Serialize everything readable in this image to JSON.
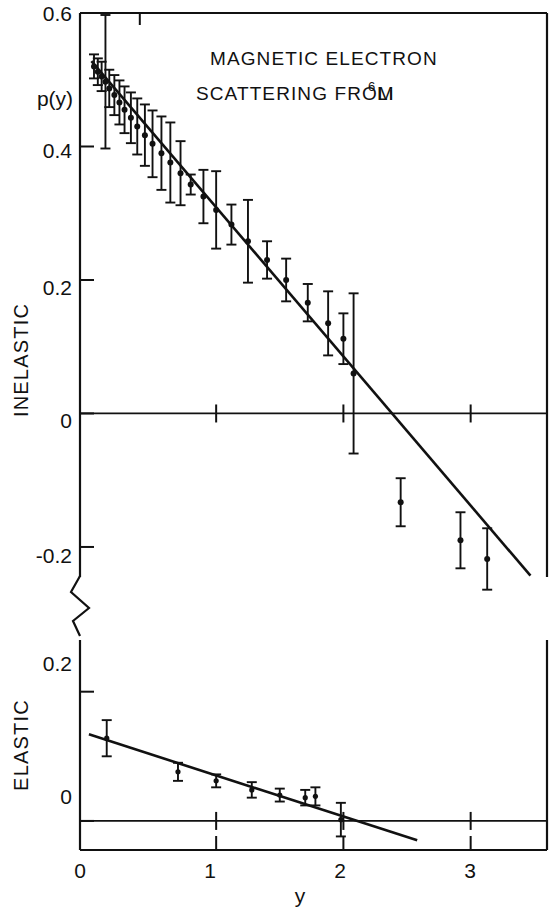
{
  "figure": {
    "title_line1": "MAGNETIC ELECTRON",
    "title_line2_pre": "SCATTERING FROM",
    "title_isotope_sup": "6",
    "title_isotope_el": "Li",
    "ylabel": "p(y)",
    "xlabel": "y",
    "panel_top_label": "INELASTIC",
    "panel_bottom_label": "ELASTIC",
    "ink_color": "#111111",
    "background_color": "#ffffff"
  },
  "axes": {
    "x_ticks": [
      "0",
      "1",
      "2",
      "3"
    ],
    "x_tick_values": [
      0,
      1,
      2,
      3
    ],
    "x_range": [
      -0.07,
      3.6
    ],
    "top_y_ticks": [
      "0.6",
      "0.4",
      "0.2",
      "0",
      "-0.2"
    ],
    "top_y_tick_values": [
      0.6,
      0.4,
      0.2,
      0,
      -0.2
    ],
    "top_y_range": [
      -0.245,
      0.6
    ],
    "bottom_y_ticks": [
      "0.2",
      "0"
    ],
    "bottom_y_tick_values": [
      0.2,
      0
    ],
    "bottom_y_range": [
      -0.045,
      0.28
    ],
    "axis_break": true,
    "grid": false
  },
  "chart_data": {
    "type": "scatter",
    "xlabel": "y",
    "ylabel": "p(y)",
    "panels": [
      {
        "name": "INELASTIC",
        "ylim": [
          -0.245,
          0.6
        ],
        "xlim": [
          -0.07,
          3.6
        ],
        "yticks": [
          0.6,
          0.4,
          0.2,
          0,
          -0.2
        ],
        "fit_line": {
          "x": [
            0.02,
            3.47
          ],
          "y": [
            0.528,
            -0.243
          ],
          "label": "linear fit"
        },
        "series": [
          {
            "name": "inelastic p(y)",
            "marker": "filled-circle-with-errorbars",
            "points": [
              {
                "x": 0.04,
                "y": 0.52,
                "yerr": 0.018
              },
              {
                "x": 0.07,
                "y": 0.512,
                "yerr": 0.02
              },
              {
                "x": 0.1,
                "y": 0.505,
                "yerr": 0.022
              },
              {
                "x": 0.13,
                "y": 0.497,
                "yerr": 0.1
              },
              {
                "x": 0.16,
                "y": 0.487,
                "yerr": 0.028
              },
              {
                "x": 0.2,
                "y": 0.477,
                "yerr": 0.03
              },
              {
                "x": 0.24,
                "y": 0.466,
                "yerr": 0.033
              },
              {
                "x": 0.28,
                "y": 0.455,
                "yerr": 0.035
              },
              {
                "x": 0.33,
                "y": 0.443,
                "yerr": 0.038
              },
              {
                "x": 0.38,
                "y": 0.43,
                "yerr": 0.042
              },
              {
                "x": 0.44,
                "y": 0.417,
                "yerr": 0.046
              },
              {
                "x": 0.5,
                "y": 0.404,
                "yerr": 0.05
              },
              {
                "x": 0.57,
                "y": 0.39,
                "yerr": 0.055
              },
              {
                "x": 0.64,
                "y": 0.376,
                "yerr": 0.06
              },
              {
                "x": 0.72,
                "y": 0.36,
                "yerr": 0.048
              },
              {
                "x": 0.8,
                "y": 0.343,
                "yerr": 0.015
              },
              {
                "x": 0.9,
                "y": 0.325,
                "yerr": 0.04
              },
              {
                "x": 1.0,
                "y": 0.305,
                "yerr": 0.058
              },
              {
                "x": 1.12,
                "y": 0.283,
                "yerr": 0.03
              },
              {
                "x": 1.25,
                "y": 0.258,
                "yerr": 0.062
              },
              {
                "x": 1.4,
                "y": 0.23,
                "yerr": 0.028
              },
              {
                "x": 1.55,
                "y": 0.2,
                "yerr": 0.032
              },
              {
                "x": 1.72,
                "y": 0.166,
                "yerr": 0.028
              },
              {
                "x": 1.88,
                "y": 0.135,
                "yerr": 0.048
              },
              {
                "x": 2.0,
                "y": 0.112,
                "yerr": 0.038
              },
              {
                "x": 2.08,
                "y": 0.06,
                "yerr": 0.12
              },
              {
                "x": 2.45,
                "y": -0.133,
                "yerr": 0.036
              },
              {
                "x": 2.92,
                "y": -0.19,
                "yerr": 0.042
              },
              {
                "x": 3.13,
                "y": -0.218,
                "yerr": 0.046
              }
            ]
          }
        ]
      },
      {
        "name": "ELASTIC",
        "ylim": [
          -0.045,
          0.28
        ],
        "xlim": [
          -0.07,
          3.6
        ],
        "yticks": [
          0.2,
          0
        ],
        "fit_line": {
          "x": [
            0.0,
            2.58
          ],
          "y": [
            0.134,
            -0.03
          ],
          "label": "linear fit"
        },
        "series": [
          {
            "name": "elastic p(y)",
            "marker": "filled-circle-with-errorbars",
            "points": [
              {
                "x": 0.14,
                "y": 0.128,
                "yerr": 0.028
              },
              {
                "x": 0.7,
                "y": 0.076,
                "yerr": 0.014
              },
              {
                "x": 1.0,
                "y": 0.062,
                "yerr": 0.01
              },
              {
                "x": 1.28,
                "y": 0.048,
                "yerr": 0.012
              },
              {
                "x": 1.5,
                "y": 0.04,
                "yerr": 0.01
              },
              {
                "x": 1.7,
                "y": 0.036,
                "yerr": 0.012
              },
              {
                "x": 1.78,
                "y": 0.038,
                "yerr": 0.014
              },
              {
                "x": 1.98,
                "y": 0.002,
                "yerr": 0.026
              }
            ]
          }
        ]
      }
    ]
  }
}
